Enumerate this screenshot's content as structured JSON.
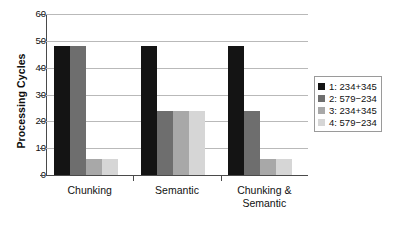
{
  "chart_data": {
    "type": "bar",
    "title": "",
    "xlabel": "",
    "ylabel": "Processing Cycles",
    "ylim": [
      0,
      60
    ],
    "yticks": [
      0,
      10,
      20,
      30,
      40,
      50,
      60
    ],
    "ytick_labels": [
      "0",
      "10",
      "20",
      "30",
      "40",
      "50",
      "60"
    ],
    "grid": true,
    "legend_position": "right",
    "categories": [
      "Chunking",
      "Semantic",
      "Chunking & Semantic"
    ],
    "category_lines": [
      [
        "Chunking"
      ],
      [
        "Semantic"
      ],
      [
        "Chunking &",
        "Semantic"
      ]
    ],
    "series": [
      {
        "name": "1: 234+345",
        "color": "#141414",
        "values": [
          48,
          48,
          48
        ]
      },
      {
        "name": "2: 579−234",
        "color": "#6e6e6e",
        "values": [
          48,
          24,
          24
        ]
      },
      {
        "name": "3: 234+345",
        "color": "#a8a8a8",
        "values": [
          6,
          24,
          6
        ]
      },
      {
        "name": "4: 579−234",
        "color": "#d6d6d6",
        "values": [
          6,
          24,
          6
        ]
      }
    ]
  },
  "legend": {
    "items": [
      {
        "label": "1: 234+345",
        "color": "#141414"
      },
      {
        "label": "2: 579−234",
        "color": "#6e6e6e"
      },
      {
        "label": "3: 234+345",
        "color": "#a8a8a8"
      },
      {
        "label": "4: 579−234",
        "color": "#d6d6d6"
      }
    ]
  }
}
